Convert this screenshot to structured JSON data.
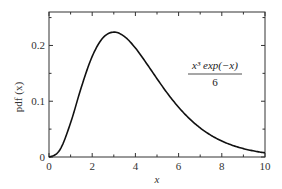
{
  "chart_data": {
    "type": "line",
    "title": "",
    "xlabel": "x",
    "ylabel": "pdf (x)",
    "xlim": [
      0,
      10
    ],
    "ylim": [
      0,
      0.26
    ],
    "grid": false,
    "legend": "none",
    "x_ticks": [
      "0",
      "2",
      "4",
      "6",
      "8",
      "10"
    ],
    "y_ticks": [
      "0",
      "0.1",
      "0.2"
    ],
    "annotation": {
      "numerator": "x³ exp(−x)",
      "denominator": "6"
    },
    "series": [
      {
        "name": "x^3 exp(-x) / 6",
        "x": [
          0,
          0.5,
          1,
          1.5,
          2,
          2.5,
          3,
          3.5,
          4,
          4.5,
          5,
          5.5,
          6,
          6.5,
          7,
          7.5,
          8,
          8.5,
          9,
          9.5,
          10
        ],
        "values": [
          0,
          0.0126,
          0.0613,
          0.1255,
          0.1804,
          0.2138,
          0.224,
          0.2158,
          0.1954,
          0.1687,
          0.1404,
          0.1133,
          0.0892,
          0.0688,
          0.0521,
          0.0389,
          0.0286,
          0.0208,
          0.015,
          0.0107,
          0.0076
        ]
      }
    ]
  }
}
